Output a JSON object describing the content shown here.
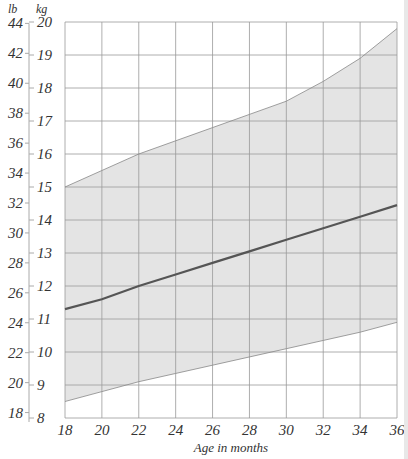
{
  "chart_data": {
    "type": "area",
    "title": "",
    "xlabel": "Age in months",
    "ylabel_left_unit": "lb",
    "ylabel_right_unit": "kg",
    "x": [
      18,
      20,
      22,
      24,
      26,
      28,
      30,
      32,
      34,
      36
    ],
    "xlim": [
      18,
      36
    ],
    "ylim_kg": [
      8,
      20
    ],
    "ylim_lb": [
      18,
      44
    ],
    "kg_ticks": [
      8,
      9,
      10,
      11,
      12,
      13,
      14,
      15,
      16,
      17,
      18,
      19,
      20
    ],
    "lb_ticks": [
      18,
      20,
      22,
      24,
      26,
      28,
      30,
      32,
      34,
      36,
      38,
      40,
      42,
      44
    ],
    "grid": true,
    "series": [
      {
        "name": "Upper range",
        "values": [
          15.0,
          15.5,
          16.0,
          16.4,
          16.8,
          17.2,
          17.6,
          18.2,
          18.9,
          19.8
        ]
      },
      {
        "name": "Average",
        "values": [
          11.3,
          11.6,
          12.0,
          12.35,
          12.7,
          13.05,
          13.4,
          13.75,
          14.1,
          14.45
        ]
      },
      {
        "name": "Lower range",
        "values": [
          8.5,
          8.8,
          9.1,
          9.35,
          9.6,
          9.85,
          10.1,
          10.35,
          10.6,
          10.9
        ]
      }
    ],
    "colors": {
      "band": "#e4e4e4",
      "average_line": "#555555",
      "bound_line": "#888888",
      "grid": "#999999"
    }
  }
}
